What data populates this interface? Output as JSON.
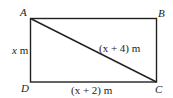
{
  "diagram": {
    "type": "rectangle-with-diagonal",
    "vertices": {
      "A": "A",
      "B": "B",
      "C": "C",
      "D": "D"
    },
    "sides": {
      "AD": "x m",
      "DC": "(x + 2) m",
      "AC": "(x + 4) m"
    },
    "labels": {
      "side_ad_var": "x",
      "side_ad_unit": " m",
      "side_dc": "(x + 2) m",
      "diag_ac": "(x + 4) m"
    },
    "line_color": "#222222"
  }
}
